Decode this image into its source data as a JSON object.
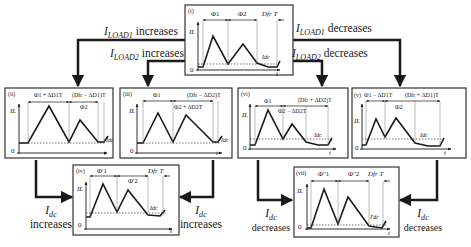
{
  "flow_labels": {
    "iload1_increases": {
      "var": "I",
      "sub": "LOAD1",
      "text": "increases"
    },
    "iload2_increases": {
      "var": "I",
      "sub": "LOAD2",
      "text": "increases"
    },
    "iload1_decreases": {
      "var": "I",
      "sub": "LOAD1",
      "text": "decreases"
    },
    "iload2_decreases": {
      "var": "I",
      "sub": "LOAD2",
      "text": "decreases"
    },
    "idc_increases_left": {
      "var": "I",
      "sub": "dc",
      "text": "increases"
    },
    "idc_increases_right": {
      "var": "I",
      "sub": "dc",
      "text": "increases"
    },
    "idc_decreases_left": {
      "var": "I",
      "sub": "dc",
      "text": "decreases"
    },
    "idc_decreases_right": {
      "var": "I",
      "sub": "dc",
      "text": "decreases"
    }
  },
  "panels": [
    {
      "id": "i",
      "tag": "(i)",
      "seg1": "Φ1",
      "seg2": "Φ2",
      "seg3": "Dfr T",
      "extra": "",
      "ylabel": "IL",
      "origin": "0",
      "xlabel": "t",
      "dc_label": "Idc"
    },
    {
      "id": "ii",
      "tag": "(ii)",
      "seg1": "Φ1 + ΔD1T",
      "seg2": "(Dfr − ΔD1)T",
      "seg_mid": "Φ2",
      "ylabel": "IL",
      "origin": "0",
      "xlabel": "t",
      "dc_label": "Idc"
    },
    {
      "id": "iii",
      "tag": "(iii)",
      "seg1": "Φ1",
      "seg2": "(Dfr − ΔD2)T",
      "seg_mid": "Φ2 + ΔD2T",
      "ylabel": "IL",
      "origin": "0",
      "xlabel": "t",
      "dc_label": "Idc"
    },
    {
      "id": "vi",
      "tag": "(vi)",
      "seg1": "Φ1",
      "seg2": "(Dfr + ΔD2)T",
      "seg_mid": "Φ2 − ΔD2T",
      "ylabel": "IL",
      "origin": "0",
      "xlabel": "t",
      "dc_label": "Idc"
    },
    {
      "id": "v",
      "tag": "(v)",
      "seg1": "Φ1 − ΔD1T",
      "seg2": "(Dfr + ΔD1)T",
      "seg_mid": "Φ2",
      "ylabel": "IL",
      "origin": "0",
      "xlabel": "t",
      "dc_label": "Idc"
    },
    {
      "id": "iv",
      "tag": "(iv)",
      "seg1": "Φ'1",
      "seg2": "Φ'2",
      "seg3": "Dfr T",
      "ylabel": "IL",
      "origin": "0",
      "xlabel": "t",
      "dc_label": "Idc"
    },
    {
      "id": "vii",
      "tag": "(vii)",
      "seg1": "Φ''1",
      "seg2": "Φ''2",
      "seg3": "Dfr T",
      "ylabel": "IL",
      "origin": "0",
      "xlabel": "t",
      "dc_label": "I'dc"
    }
  ],
  "colors": {
    "line": "#1a1a1a",
    "box": "#333333",
    "background": "#ffffff",
    "dotted": "#333333"
  }
}
